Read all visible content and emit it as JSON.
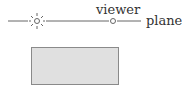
{
  "labels": {
    "viewer": "viewer",
    "plane": "plane"
  },
  "icons": {
    "light_source": "sun-icon",
    "viewer_point": "circle-icon"
  },
  "colors": {
    "line": "#666666",
    "box_fill": "#e0e0e0",
    "box_border": "#8a8a8a",
    "text": "#333333"
  }
}
